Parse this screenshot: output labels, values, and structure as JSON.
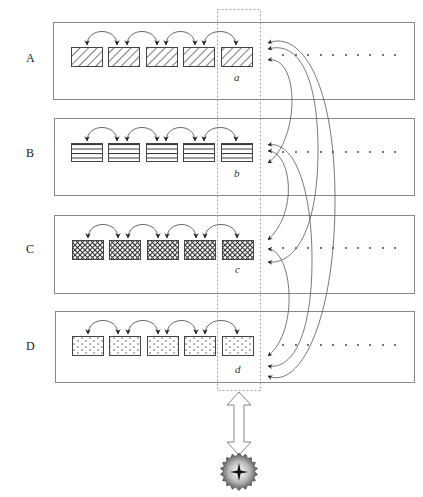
{
  "diagram": {
    "rows": [
      {
        "label": "A",
        "pattern": "diagonal-hatch",
        "column_label": "a"
      },
      {
        "label": "B",
        "pattern": "horizontal-lines",
        "column_label": "b"
      },
      {
        "label": "C",
        "pattern": "crosshatch",
        "column_label": "c"
      },
      {
        "label": "D",
        "pattern": "dots",
        "column_label": "d"
      }
    ],
    "cells_per_row": 5,
    "ellipsis_dots_per_row": 10,
    "highlighted_column": "dashed selection around 5th cell of each row",
    "connector": "double-headed arrow",
    "bottom_icon": "sunburst-star-icon",
    "colors": {
      "stroke": "#555555",
      "panel_border": "#888888",
      "dashed": "#999999",
      "text": "#222222"
    }
  }
}
